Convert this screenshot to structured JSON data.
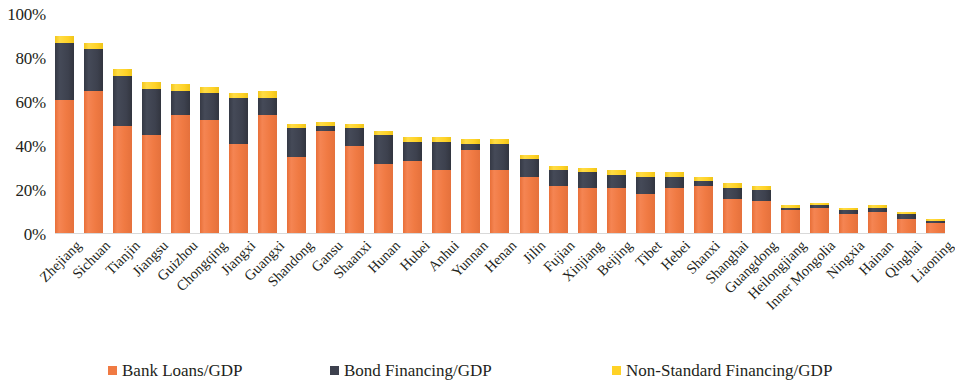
{
  "chart_data": {
    "type": "bar",
    "stacked": true,
    "title": "",
    "subtitle": "",
    "xlabel": "",
    "ylabel": "",
    "ylim": [
      0,
      100
    ],
    "yticks": [
      "0%",
      "20%",
      "40%",
      "60%",
      "80%",
      "100%"
    ],
    "ytick_values": [
      0,
      20,
      40,
      60,
      80,
      100
    ],
    "grid": false,
    "legend_position": "bottom",
    "unit": "%",
    "categories": [
      "Zhejiang",
      "Sichuan",
      "Tianjin",
      "Jiangsu",
      "Guizhou",
      "Chongqing",
      "Jiangxi",
      "Guangxi",
      "Shandong",
      "Gansu",
      "Shaanxi",
      "Hunan",
      "Hubei",
      "Anhui",
      "Yunnan",
      "Henan",
      "Jilin",
      "Fujian",
      "Xinjiang",
      "Beijing",
      "Tibet",
      "Hebei",
      "Shanxi",
      "Shanghai",
      "Guangdong",
      "Heilongjiang",
      "Inner Mongolia",
      "Ningxia",
      "Hainan",
      "Qinghai",
      "Liaoning"
    ],
    "series": [
      {
        "name": "Bank Loans/GDP",
        "color": "#f07a43",
        "values": [
          61,
          65,
          49,
          45,
          54,
          52,
          41,
          54,
          35,
          47,
          40,
          32,
          33,
          29,
          38,
          29,
          26,
          22,
          21,
          21,
          18,
          21,
          22,
          16,
          15,
          11,
          12,
          9,
          10,
          7,
          5
        ]
      },
      {
        "name": "Bond Financing/GDP",
        "color": "#3d414e",
        "values": [
          26,
          19,
          23,
          21,
          11,
          12,
          21,
          8,
          13,
          2,
          8,
          13,
          9,
          13,
          3,
          12,
          8,
          7,
          7,
          6,
          8,
          5,
          2,
          5,
          5,
          1,
          1,
          2,
          2,
          2,
          1
        ]
      },
      {
        "name": "Non-Standard  Financing/GDP",
        "color": "#ffd226",
        "values": [
          3,
          3,
          3,
          3,
          3,
          3,
          2,
          3,
          2,
          2,
          2,
          2,
          2,
          2,
          2,
          2,
          2,
          2,
          2,
          2,
          2,
          2,
          2,
          2,
          2,
          1,
          1,
          1,
          1,
          1,
          1
        ]
      }
    ]
  },
  "legend": {
    "items": [
      {
        "label": "Bank Loans/GDP",
        "color": "#f07a43",
        "swatch_name": "legend-swatch-bank-loans"
      },
      {
        "label": "Bond Financing/GDP",
        "color": "#3d414e",
        "swatch_name": "legend-swatch-bond-financing"
      },
      {
        "label": "Non-Standard  Financing/GDP",
        "color": "#ffd226",
        "swatch_name": "legend-swatch-non-standard-financing"
      }
    ]
  }
}
